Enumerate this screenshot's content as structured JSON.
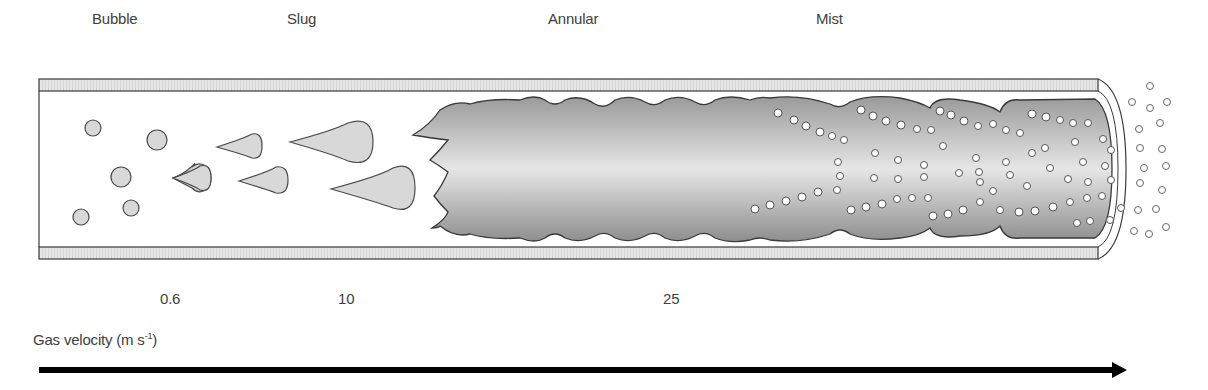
{
  "regimes": [
    {
      "label": "Bubble",
      "x": 92
    },
    {
      "label": "Slug",
      "x": 287
    },
    {
      "label": "Annular",
      "x": 548
    },
    {
      "label": "Mist",
      "x": 816
    }
  ],
  "velocity_ticks": [
    {
      "label": "0.6",
      "x": 160
    },
    {
      "label": "10",
      "x": 338
    },
    {
      "label": "25",
      "x": 663
    }
  ],
  "axis": {
    "label_prefix": "Gas velocity (m s",
    "label_exp": "-1",
    "label_suffix": ")"
  },
  "colors": {
    "wall_fill": "#e3e3e3",
    "outline": "#3a3a3a",
    "liquid_dark": "#9a9a9a",
    "liquid_light": "#e8e8e8",
    "bubble_fill": "#d8d8d8",
    "arrow": "#000000"
  }
}
